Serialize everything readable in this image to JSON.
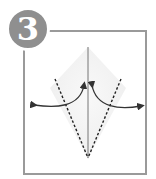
{
  "step": {
    "number": "3",
    "badge_color": "#8f8f8f",
    "frame_color": "#9a9a9a"
  },
  "diagram": {
    "paper_color": "#f2f2f2",
    "line_color": "#333333"
  }
}
